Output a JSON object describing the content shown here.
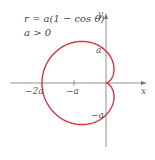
{
  "diagram": {
    "equation": "r = a(1 − cos θ)",
    "condition": "a > 0",
    "axes": {
      "x_label": "x",
      "y_label": "y"
    },
    "ticks": {
      "x_neg2a": "−2a",
      "x_nega": "−a",
      "y_a": "a",
      "y_nega": "−a"
    },
    "colors": {
      "curve": "#d8343f",
      "axes": "#777777",
      "text": "#555555"
    },
    "curve_type": "cardioid"
  }
}
